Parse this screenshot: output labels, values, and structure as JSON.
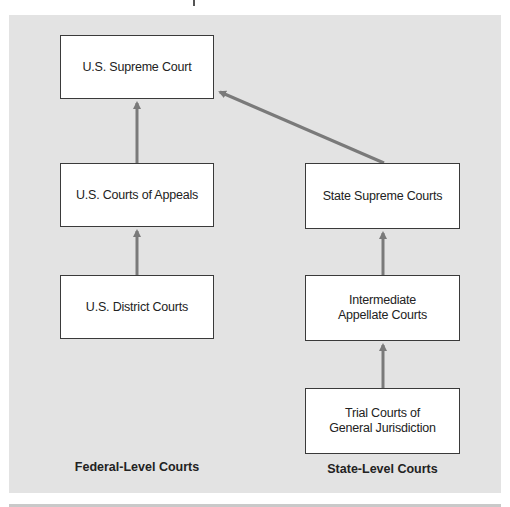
{
  "diagram": {
    "colors": {
      "panel_background": "#e3e3e3",
      "box_fill": "#ffffff",
      "box_border": "#3a3a3a",
      "arrow": "#7a7a7a"
    },
    "nodes": {
      "us_supreme_court": "U.S. Supreme Court",
      "us_courts_of_appeals": "U.S. Courts of Appeals",
      "us_district_courts": "U.S. District Courts",
      "state_supreme_courts": "State Supreme Courts",
      "intermediate_appellate_courts_line1": "Intermediate",
      "intermediate_appellate_courts_line2": "Appellate Courts",
      "trial_courts_line1": "Trial Courts of",
      "trial_courts_line2": "General Jurisdiction"
    },
    "edges": [
      {
        "from": "U.S. District Courts",
        "to": "U.S. Courts of Appeals"
      },
      {
        "from": "U.S. Courts of Appeals",
        "to": "U.S. Supreme Court"
      },
      {
        "from": "Trial Courts of General Jurisdiction",
        "to": "Intermediate Appellate Courts"
      },
      {
        "from": "Intermediate Appellate Courts",
        "to": "State Supreme Courts"
      },
      {
        "from": "State Supreme Courts",
        "to": "U.S. Supreme Court"
      }
    ],
    "column_labels": {
      "federal": "Federal-Level Courts",
      "state": "State-Level Courts"
    }
  }
}
